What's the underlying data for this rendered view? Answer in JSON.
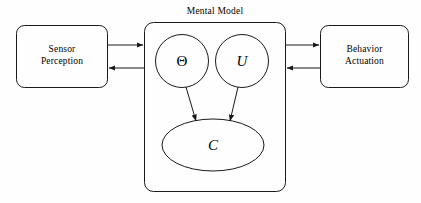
{
  "diagram": {
    "title": "Mental Model",
    "background_color": "#fefefe",
    "stroke_color": "#1a1a1a",
    "text_color": "#000000",
    "nodes": {
      "sensor_box": {
        "label": "Sensor\nPerception",
        "shape": "rounded-rectangle"
      },
      "behavior_box": {
        "label": "Behavior\nActuation",
        "shape": "rounded-rectangle"
      },
      "mental_model_container": {
        "label": "Mental Model",
        "shape": "rounded-rectangle"
      },
      "theta_node": {
        "label": "Θ",
        "shape": "circle"
      },
      "u_node": {
        "label": "U",
        "shape": "circle"
      },
      "c_node": {
        "label": "C",
        "shape": "ellipse"
      }
    },
    "edges": [
      {
        "name": "sensor-to-model",
        "from": "sensor_box",
        "to": "mental_model_container",
        "direction": "right"
      },
      {
        "name": "model-to-sensor",
        "from": "mental_model_container",
        "to": "sensor_box",
        "direction": "left"
      },
      {
        "name": "model-to-behavior",
        "from": "mental_model_container",
        "to": "behavior_box",
        "direction": "right"
      },
      {
        "name": "behavior-to-model",
        "from": "behavior_box",
        "to": "mental_model_container",
        "direction": "left"
      },
      {
        "name": "theta-to-c",
        "from": "theta_node",
        "to": "c_node",
        "direction": "down"
      },
      {
        "name": "u-to-c",
        "from": "u_node",
        "to": "c_node",
        "direction": "down"
      }
    ]
  }
}
